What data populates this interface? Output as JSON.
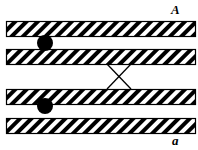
{
  "diagram": {
    "labels": {
      "top": "A",
      "bottom": "a"
    },
    "chromatids": [
      {
        "id": "chromatid-1",
        "x": 6,
        "y": 21,
        "width": 189,
        "height": 15
      },
      {
        "id": "chromatid-2",
        "x": 6,
        "y": 49,
        "width": 189,
        "height": 15
      },
      {
        "id": "chromatid-3",
        "x": 6,
        "y": 89,
        "width": 189,
        "height": 15
      },
      {
        "id": "chromatid-4",
        "x": 6,
        "y": 118,
        "width": 189,
        "height": 15
      }
    ],
    "centromeres": [
      {
        "id": "centromere-top",
        "cx": 45,
        "cy": 43,
        "r": 8
      },
      {
        "id": "centromere-bottom",
        "cx": 45,
        "cy": 106,
        "r": 8
      }
    ],
    "crossover": {
      "x1": 107,
      "y1": 64,
      "x2": 131,
      "y2": 89
    },
    "colors": {
      "stroke": "#000000",
      "fill": "#ffffff",
      "hatch": "#000000"
    }
  }
}
